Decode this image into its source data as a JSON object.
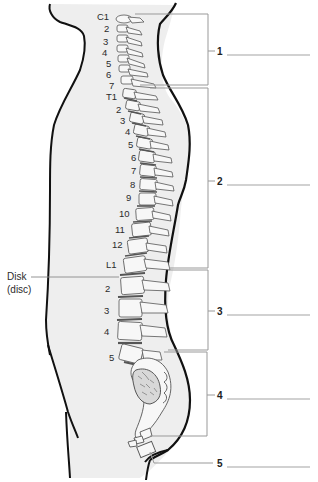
{
  "diagram": {
    "colors": {
      "background": "#ffffff",
      "body_fill": "#eeeeee",
      "outline": "#111111",
      "bone_fill": "#f7f7f7",
      "bone_stroke": "#555555",
      "disc": "#555555",
      "leader": "#888888",
      "answer_line": "#999999"
    },
    "vertebra_labels": [
      {
        "text": "C1",
        "x": 97,
        "y": 20
      },
      {
        "text": "2",
        "x": 104,
        "y": 32
      },
      {
        "text": "3",
        "x": 103,
        "y": 45
      },
      {
        "text": "4",
        "x": 102,
        "y": 56
      },
      {
        "text": "5",
        "x": 106,
        "y": 67
      },
      {
        "text": "6",
        "x": 106,
        "y": 78
      },
      {
        "text": "7",
        "x": 109,
        "y": 89
      },
      {
        "text": "T1",
        "x": 106,
        "y": 100
      },
      {
        "text": "2",
        "x": 116,
        "y": 113
      },
      {
        "text": "3",
        "x": 120,
        "y": 124
      },
      {
        "text": "4",
        "x": 125,
        "y": 135
      },
      {
        "text": "5",
        "x": 128,
        "y": 148
      },
      {
        "text": "6",
        "x": 131,
        "y": 161
      },
      {
        "text": "7",
        "x": 131,
        "y": 174
      },
      {
        "text": "8",
        "x": 130,
        "y": 188
      },
      {
        "text": "9",
        "x": 126,
        "y": 201
      },
      {
        "text": "10",
        "x": 119,
        "y": 217
      },
      {
        "text": "11",
        "x": 115,
        "y": 233
      },
      {
        "text": "12",
        "x": 112,
        "y": 248
      },
      {
        "text": "L1",
        "x": 106,
        "y": 268
      },
      {
        "text": "2",
        "x": 105,
        "y": 292
      },
      {
        "text": "3",
        "x": 104,
        "y": 314
      },
      {
        "text": "4",
        "x": 104,
        "y": 335
      },
      {
        "text": "5",
        "x": 109,
        "y": 361
      }
    ],
    "disk_label": {
      "line1": "Disk",
      "line2": "(disc)"
    },
    "regions": [
      {
        "number": "1",
        "bracket_top": 14,
        "bracket_bottom": 85,
        "label_y": 51
      },
      {
        "number": "2",
        "bracket_top": 88,
        "bracket_bottom": 268,
        "label_y": 181
      },
      {
        "number": "3",
        "bracket_top": 270,
        "bracket_bottom": 350,
        "label_y": 311
      },
      {
        "number": "4",
        "bracket_top": 352,
        "bracket_bottom": 436,
        "label_y": 395
      },
      {
        "number": "5",
        "bracket_top": null,
        "bracket_bottom": null,
        "label_y": 463
      }
    ]
  }
}
